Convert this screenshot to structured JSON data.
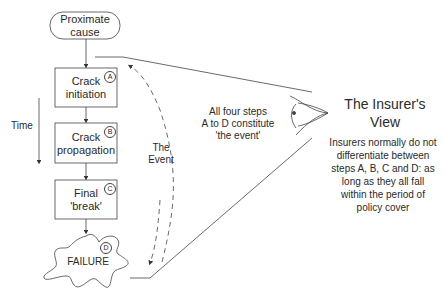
{
  "diagram": {
    "nodes": {
      "proximate_cause": {
        "line1": "Proximate",
        "line2": "cause"
      },
      "step_a": {
        "line1": "Crack",
        "line2": "initiation",
        "badge": "A"
      },
      "step_b": {
        "line1": "Crack",
        "line2": "propagation",
        "badge": "B"
      },
      "step_c": {
        "line1": "Final",
        "line2": "'break'",
        "badge": "C"
      },
      "step_d": {
        "label": "FAILURE",
        "badge": "D"
      }
    },
    "time_label": "Time",
    "event_label": {
      "line1": "The",
      "line2": "Event"
    },
    "steps_note": {
      "line1": "All four steps",
      "line2": "A to D constitute",
      "line3": "'the event'"
    },
    "insurer": {
      "title_line1": "The Insurer's",
      "title_line2": "View",
      "desc_lines": [
        "Insurers normally do not",
        "differentiate between",
        "steps A, B, C and D: as",
        "long as they all fall",
        "within the period of",
        "policy cover"
      ]
    },
    "icons": {
      "eye": "eye-icon"
    },
    "colors": {
      "stroke": "#444444",
      "text": "#2a2a2a",
      "background": "#ffffff"
    }
  }
}
